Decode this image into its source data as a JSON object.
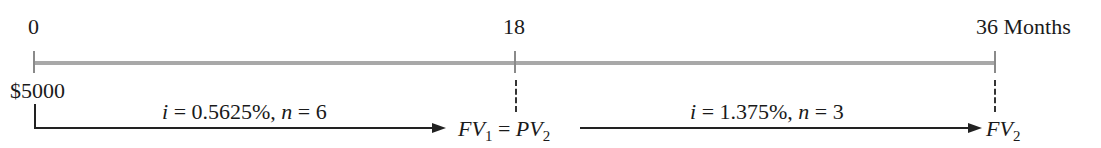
{
  "timeline": {
    "ticks": [
      {
        "label": "0",
        "x": 34
      },
      {
        "label": "18",
        "x": 515
      },
      {
        "label": "36 Months",
        "x": 995
      }
    ],
    "unit": "Months"
  },
  "cash_flows": {
    "start_amount": "$5000"
  },
  "segments": [
    {
      "interest_label": "i",
      "interest_value": "= 0.5625%,",
      "n_label": "n",
      "n_value": "= 6"
    },
    {
      "interest_label": "i",
      "interest_value": "= 1.375%,",
      "n_label": "n",
      "n_value": "= 3"
    }
  ],
  "labels": {
    "fv1_main": "FV",
    "fv1_sub": "1",
    "equals": "=",
    "pv2_main": "PV",
    "pv2_sub": "2",
    "fv2_main": "FV",
    "fv2_sub": "2"
  },
  "colors": {
    "timeline": "#a8a8a8",
    "text": "#1a1a1a"
  }
}
